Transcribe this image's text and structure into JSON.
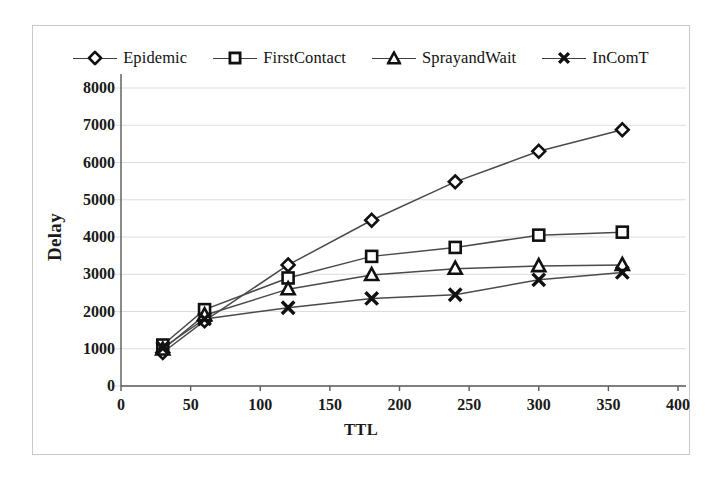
{
  "chart_data": {
    "type": "line",
    "title": "",
    "xlabel": "TTL",
    "ylabel": "Delay",
    "x": [
      30,
      60,
      120,
      180,
      240,
      300,
      360
    ],
    "xlim": [
      0,
      400
    ],
    "ylim": [
      0,
      8000
    ],
    "xticks": [
      0,
      50,
      100,
      150,
      200,
      250,
      300,
      350,
      400
    ],
    "yticks": [
      0,
      1000,
      2000,
      3000,
      4000,
      5000,
      6000,
      7000,
      8000
    ],
    "grid": "horizontal",
    "legend_position": "top-center",
    "series": [
      {
        "name": "Epidemic",
        "marker": "diamond",
        "values": [
          900,
          1750,
          3250,
          4450,
          5480,
          6300,
          6880
        ]
      },
      {
        "name": "FirstContact",
        "marker": "square",
        "values": [
          1100,
          2050,
          2900,
          3480,
          3720,
          4050,
          4130
        ]
      },
      {
        "name": "SprayandWait",
        "marker": "triangle",
        "values": [
          980,
          1900,
          2600,
          2980,
          3150,
          3220,
          3250
        ]
      },
      {
        "name": "InComT",
        "marker": "x",
        "values": [
          1020,
          1800,
          2100,
          2350,
          2450,
          2850,
          3050
        ]
      }
    ]
  },
  "colors": {
    "line": "#4a4a4a",
    "marker_stroke": "#111111",
    "grid": "#dcdcdc",
    "axis": "#5a5a5a",
    "frame": "#c9c9c9",
    "background": "#ffffff"
  }
}
